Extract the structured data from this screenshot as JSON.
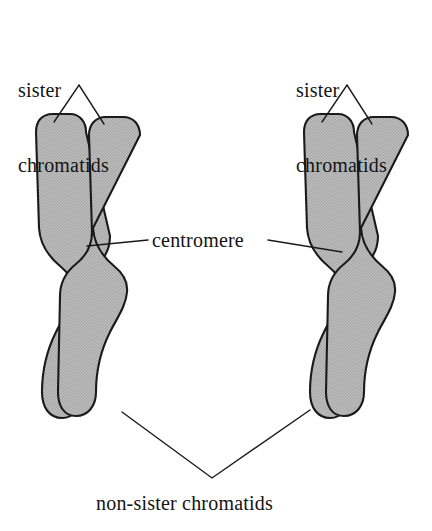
{
  "figure": {
    "background_color": "#ffffff",
    "line_color": "#1a1a1a",
    "chromatid_fill_color": "#b5b5b5",
    "chromatid_outline_color": "#1a1a1a",
    "text_color": "#141414"
  },
  "labels": {
    "sister_left_line1": "sister",
    "sister_left_line2": "chromatids",
    "sister_right_line1": "sister",
    "sister_right_line2": "chromatids",
    "centromere": "centromere",
    "non_sister": "non-sister chromatids"
  },
  "structures": {
    "left_chromosome": "left-chromosome",
    "right_chromosome": "right-chromosome",
    "left_chromatid_a": "left-chromatid-a",
    "left_chromatid_b": "left-chromatid-b",
    "right_chromatid_a": "right-chromatid-a",
    "right_chromatid_b": "right-chromatid-b",
    "left_centromere": "left-centromere",
    "right_centromere": "right-centromere"
  },
  "leader_lines": {
    "sister_left": "two-branch leader from label apex to the two upper chromatid tips of the left chromosome",
    "sister_right": "two-branch leader from label apex to the two upper chromatid tips of the right chromosome",
    "centromere_left": "leader from the left of the centromere label to the waist of the left chromosome",
    "centromere_right": "leader from the right of the centromere label to the waist of the right chromosome",
    "non_sister": "V-shaped leader from the label apex to the inner lower arm tips of both chromosomes"
  }
}
